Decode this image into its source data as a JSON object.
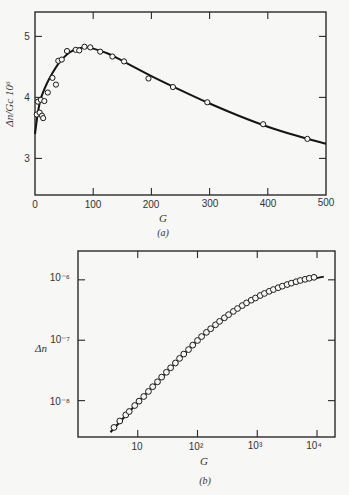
{
  "chart_data": [
    {
      "id": "a",
      "type": "scatter",
      "caption": "(a)",
      "title": "",
      "xlabel": "G",
      "ylabel": "Δn/Gc 10^6",
      "ylabel_display": "Δn/Gc 10⁶",
      "xlim": [
        0,
        500
      ],
      "ylim": [
        2.4,
        5.4
      ],
      "x_ticks": [
        0,
        100,
        200,
        300,
        400,
        500
      ],
      "x_tick_labels": [
        "0",
        "100",
        "200",
        "300",
        "400",
        "500"
      ],
      "y_ticks": [
        3,
        4,
        5
      ],
      "y_tick_labels": [
        "3",
        "4",
        "5"
      ],
      "grid": false,
      "legend": null,
      "series": [
        {
          "name": "measured",
          "marker": "open-circle",
          "points": [
            [
              3,
              3.72
            ],
            [
              5,
              3.93
            ],
            [
              8,
              3.75
            ],
            [
              10,
              3.96
            ],
            [
              12,
              3.7
            ],
            [
              14,
              3.66
            ],
            [
              16,
              3.94
            ],
            [
              22,
              4.08
            ],
            [
              30,
              4.32
            ],
            [
              36,
              4.21
            ],
            [
              40,
              4.6
            ],
            [
              46,
              4.62
            ],
            [
              55,
              4.76
            ],
            [
              70,
              4.78
            ],
            [
              76,
              4.77
            ],
            [
              85,
              4.83
            ],
            [
              95,
              4.82
            ],
            [
              112,
              4.75
            ],
            [
              133,
              4.67
            ],
            [
              153,
              4.59
            ],
            [
              195,
              4.31
            ],
            [
              237,
              4.17
            ],
            [
              296,
              3.92
            ],
            [
              392,
              3.56
            ],
            [
              468,
              3.32
            ]
          ]
        },
        {
          "name": "fit",
          "marker": "line",
          "points": [
            [
              0,
              3.4
            ],
            [
              5,
              3.75
            ],
            [
              10,
              3.98
            ],
            [
              20,
              4.22
            ],
            [
              30,
              4.4
            ],
            [
              40,
              4.55
            ],
            [
              50,
              4.66
            ],
            [
              60,
              4.74
            ],
            [
              70,
              4.79
            ],
            [
              85,
              4.82
            ],
            [
              100,
              4.8
            ],
            [
              125,
              4.72
            ],
            [
              150,
              4.6
            ],
            [
              200,
              4.35
            ],
            [
              250,
              4.12
            ],
            [
              300,
              3.9
            ],
            [
              350,
              3.7
            ],
            [
              400,
              3.52
            ],
            [
              450,
              3.37
            ],
            [
              500,
              3.24
            ]
          ]
        }
      ]
    },
    {
      "id": "b",
      "type": "scatter",
      "caption": "(b)",
      "title": "",
      "xlabel": "G",
      "ylabel": "Δn",
      "x_scale": "log",
      "y_scale": "log",
      "xlim": [
        1.0,
        20000
      ],
      "ylim": [
        2.5e-09,
        3e-06
      ],
      "x_ticks": [
        10,
        100,
        1000,
        10000
      ],
      "x_tick_labels": [
        "10",
        "10²",
        "10³",
        "10⁴"
      ],
      "y_ticks": [
        1e-08,
        1e-07,
        1e-06
      ],
      "y_tick_labels": [
        "10⁻⁸",
        "10⁻⁷",
        "10⁻⁶"
      ],
      "grid": false,
      "legend": null,
      "series": [
        {
          "name": "measured",
          "marker": "open-circle",
          "points": [
            [
              4.0,
              3.6e-09
            ],
            [
              5.0,
              4.6e-09
            ],
            [
              6.3,
              5.8e-09
            ],
            [
              7.2,
              6.6e-09
            ],
            [
              8.9,
              8.3e-09
            ],
            [
              10.5,
              9.8e-09
            ],
            [
              12.6,
              1.17e-08
            ],
            [
              15.1,
              1.42e-08
            ],
            [
              17.8,
              1.7e-08
            ],
            [
              21.4,
              2.05e-08
            ],
            [
              25.1,
              2.45e-08
            ],
            [
              30.2,
              2.95e-08
            ],
            [
              35.5,
              3.5e-08
            ],
            [
              42.7,
              4.2e-08
            ],
            [
              50.1,
              5e-08
            ],
            [
              58.9,
              5.9e-08
            ],
            [
              70.8,
              7e-08
            ],
            [
              83.2,
              8.3e-08
            ],
            [
              100,
              9.9e-08
            ],
            [
              117,
              1.15e-07
            ],
            [
              141,
              1.35e-07
            ],
            [
              166,
              1.55e-07
            ],
            [
              200,
              1.8e-07
            ],
            [
              234,
              2.05e-07
            ],
            [
              282,
              2.35e-07
            ],
            [
              331,
              2.65e-07
            ],
            [
              398,
              3e-07
            ],
            [
              468,
              3.35e-07
            ],
            [
              562,
              3.75e-07
            ],
            [
              661,
              4.15e-07
            ],
            [
              794,
              4.6e-07
            ],
            [
              933,
              5e-07
            ],
            [
              1120,
              5.5e-07
            ],
            [
              1318,
              5.95e-07
            ],
            [
              1585,
              6.45e-07
            ],
            [
              1862,
              6.9e-07
            ],
            [
              2239,
              7.4e-07
            ],
            [
              2630,
              7.85e-07
            ],
            [
              3162,
              8.35e-07
            ],
            [
              3715,
              8.8e-07
            ],
            [
              4467,
              9.3e-07
            ],
            [
              5248,
              9.75e-07
            ],
            [
              6310,
              1.02e-06
            ],
            [
              7413,
              1.06e-06
            ],
            [
              8913,
              1.1e-06
            ]
          ]
        },
        {
          "name": "fit",
          "marker": "line",
          "points": [
            [
              3.5,
              3e-09
            ],
            [
              10,
              9.3e-09
            ],
            [
              30,
              2.9e-08
            ],
            [
              100,
              9.9e-08
            ],
            [
              300,
              2.45e-07
            ],
            [
              1000,
              5.2e-07
            ],
            [
              3000,
              8.2e-07
            ],
            [
              13000,
              1.13e-06
            ]
          ]
        }
      ]
    }
  ],
  "panels": {
    "a": {
      "caption": "(a)",
      "xlabel": "G",
      "ylabel": "Δn/Gc 10⁶",
      "x_tick_labels": [
        "0",
        "100",
        "200",
        "300",
        "400",
        "500"
      ],
      "y_tick_labels": [
        "3",
        "4",
        "5"
      ]
    },
    "b": {
      "caption": "(b)",
      "xlabel": "G",
      "ylabel": "Δn",
      "x_tick_labels": [
        "10",
        "10²",
        "10³",
        "10⁴"
      ],
      "y_tick_labels": [
        "10⁻⁸",
        "10⁻⁷",
        "10⁻⁶"
      ]
    }
  },
  "colors": {
    "background": "#f7f7f5",
    "ink": "#1a1a1a"
  }
}
